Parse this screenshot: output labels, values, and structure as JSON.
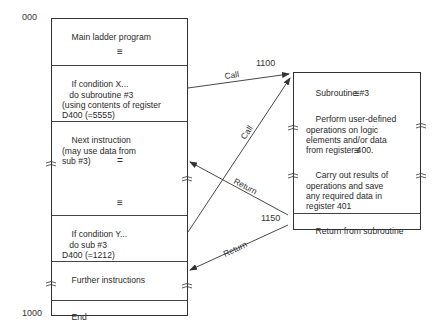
{
  "main_program": {
    "start_address": "000",
    "end_address": "1000",
    "sections": [
      {
        "id": "main",
        "text": "Main ladder program"
      },
      {
        "id": "cond_x",
        "text": "If condition X...\n   do subroutine #3\n(using contents of register\nD400 (=5555)"
      },
      {
        "id": "next",
        "text": "Next instruction\n(may use data from\nsub #3)"
      },
      {
        "id": "cond_y",
        "text": "If condition Y...\n   do sub #3\nD400 (=1212)"
      },
      {
        "id": "further",
        "text": "Further instructions"
      },
      {
        "id": "end",
        "text": "End"
      }
    ],
    "ellipsis_glyph": "≡",
    "ellipsis_small": "="
  },
  "subroutine": {
    "start_address": "1100",
    "return_address": "1150",
    "title": "Subroutine #3",
    "body_1": "Perform user-defined\noperations on logic\nelements and/or data\nfrom register 400.",
    "body_2": "Carry out results of\noperations and save\nany required data in\nregister 401",
    "footer": "Return from subroutine",
    "ellipsis_glyph": "≡"
  },
  "arrows": [
    {
      "label": "Call",
      "from": "cond_x",
      "to": "subroutine_start"
    },
    {
      "label": "Call",
      "from": "cond_y",
      "to": "subroutine_start"
    },
    {
      "label": "Return",
      "from": "subroutine_return",
      "to": "next"
    },
    {
      "label": "Return",
      "from": "subroutine_return",
      "to": "further"
    }
  ]
}
